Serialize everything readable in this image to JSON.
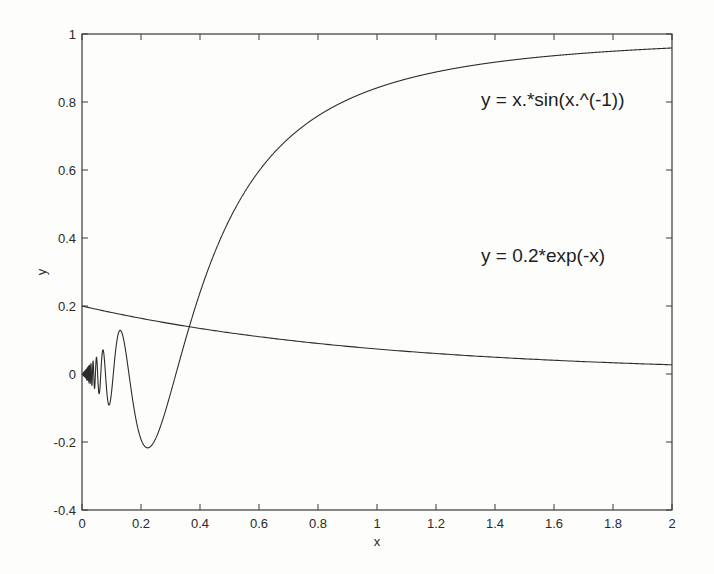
{
  "chart_data": {
    "type": "line",
    "title": "",
    "xlabel": "x",
    "ylabel": "y",
    "xlim": [
      0,
      2
    ],
    "ylim": [
      -0.4,
      1
    ],
    "grid": false,
    "legend": "none (inline text annotations)",
    "x_ticks": [
      "0",
      "0.2",
      "0.4",
      "0.6",
      "0.8",
      "1",
      "1.2",
      "1.4",
      "1.6",
      "1.8",
      "2"
    ],
    "y_ticks": [
      "-0.4",
      "-0.2",
      "0",
      "0.2",
      "0.4",
      "0.6",
      "0.8",
      "1"
    ],
    "series": [
      {
        "name": "y = x.*sin(x.^(-1))",
        "function": "x*sin(1/x)",
        "x": [
          0.02,
          0.05,
          0.1,
          0.13,
          0.22,
          0.3,
          0.36,
          0.4,
          0.5,
          0.6,
          0.8,
          1.0,
          1.2,
          1.4,
          1.6,
          1.8,
          2.0
        ],
        "values": [
          -0.005,
          0.046,
          -0.054,
          0.126,
          -0.217,
          -0.053,
          0.13,
          0.239,
          0.455,
          0.597,
          0.758,
          0.841,
          0.884,
          0.91,
          0.928,
          0.94,
          0.959
        ]
      },
      {
        "name": "y = 0.2*exp(-x)",
        "function": "0.2*exp(-x)",
        "x": [
          0,
          0.2,
          0.4,
          0.6,
          0.8,
          1.0,
          1.2,
          1.4,
          1.6,
          1.8,
          2.0
        ],
        "values": [
          0.2,
          0.164,
          0.134,
          0.11,
          0.09,
          0.074,
          0.06,
          0.049,
          0.04,
          0.033,
          0.027
        ]
      }
    ],
    "annotations": [
      {
        "text": "y = x.*sin(x.^(-1))",
        "x": 1.08,
        "y": 0.79
      },
      {
        "text": "y = 0.2*exp(-x)",
        "x": 1.08,
        "y": 0.14
      }
    ]
  }
}
